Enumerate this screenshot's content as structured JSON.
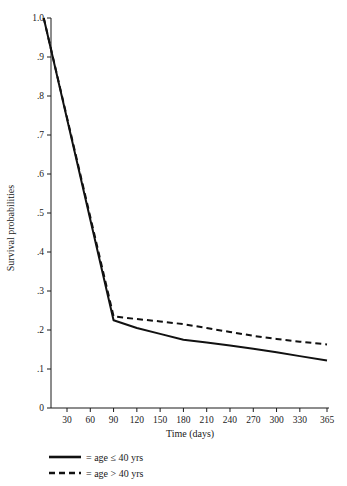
{
  "chart_data": {
    "type": "line",
    "title": "",
    "subtitle": "",
    "xlabel": "Time (days)",
    "ylabel": "Survival probabilities",
    "xlim": [
      0,
      365
    ],
    "ylim": [
      0,
      1.0
    ],
    "grid": false,
    "legend_position": "below-left",
    "x_ticks": [
      30,
      60,
      90,
      120,
      150,
      180,
      210,
      240,
      270,
      300,
      330,
      365
    ],
    "x_tick_labels": [
      "30",
      "60",
      "90",
      "120",
      "150",
      "180",
      "210",
      "240",
      "270",
      "300",
      "330",
      "365"
    ],
    "y_ticks": [
      0,
      0.1,
      0.2,
      0.3,
      0.4,
      0.5,
      0.6,
      0.7,
      0.8,
      0.9,
      1.0
    ],
    "y_tick_labels": [
      "0",
      ".1",
      ".2",
      ".3",
      ".4",
      ".5",
      ".6",
      ".7",
      ".8",
      ".9",
      "1.0"
    ],
    "series": [
      {
        "name": "age ≤ 40 yrs",
        "style": "solid",
        "color": "#111111",
        "x": [
          0,
          90,
          120,
          150,
          180,
          210,
          240,
          270,
          300,
          330,
          365
        ],
        "values": [
          1.0,
          0.225,
          0.205,
          0.19,
          0.175,
          0.168,
          0.16,
          0.152,
          0.143,
          0.133,
          0.122
        ]
      },
      {
        "name": "age > 40 yrs",
        "style": "dashed",
        "color": "#111111",
        "x": [
          0,
          90,
          120,
          150,
          180,
          210,
          240,
          270,
          300,
          330,
          365
        ],
        "values": [
          1.0,
          0.235,
          0.228,
          0.222,
          0.215,
          0.205,
          0.195,
          0.185,
          0.177,
          0.17,
          0.163
        ]
      }
    ]
  },
  "legend": {
    "items": [
      {
        "style": "solid",
        "separator": "=",
        "label": "age ≤ 40 yrs"
      },
      {
        "style": "dashed",
        "separator": "=",
        "label": "age > 40 yrs"
      }
    ]
  },
  "axes": {
    "x_title": "Time (days)",
    "y_title": "Survival probabilities"
  }
}
